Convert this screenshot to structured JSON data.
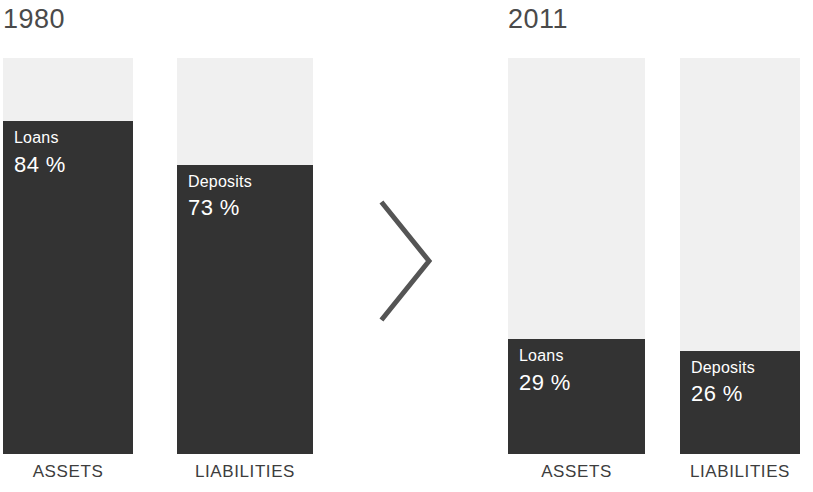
{
  "chart_data": {
    "type": "bar",
    "title": "",
    "subtitle": "",
    "xlabel": "",
    "ylabel": "",
    "ylim": [
      0,
      100
    ],
    "grid": false,
    "legend_position": "none",
    "note": "Stacked/filled bars: each bar represents 100% of the balance sheet side; the dark shaded portion is the labeled share.",
    "groups": [
      {
        "year": "1980",
        "bars": [
          {
            "category": "ASSETS",
            "series": "Loans",
            "value": 84,
            "value_label": "84 %",
            "remainder": 16
          },
          {
            "category": "LIABILITIES",
            "series": "Deposits",
            "value": 73,
            "value_label": "73 %",
            "remainder": 27
          }
        ]
      },
      {
        "year": "2011",
        "bars": [
          {
            "category": "ASSETS",
            "series": "Loans",
            "value": 29,
            "value_label": "29 %",
            "remainder": 71
          },
          {
            "category": "LIABILITIES",
            "series": "Deposits",
            "value": 26,
            "value_label": "26 %",
            "remainder": 74
          }
        ]
      }
    ],
    "categories": [
      "ASSETS",
      "LIABILITIES"
    ],
    "series": [
      {
        "name": "Loans",
        "values": [
          84,
          29
        ]
      },
      {
        "name": "Deposits",
        "values": [
          73,
          26
        ]
      }
    ],
    "x": [
      "1980",
      "2011"
    ],
    "colors": {
      "fill_dark": "#333333",
      "bar_background": "#f0f0f0",
      "page_background": "#ffffff",
      "year_text": "#4a4a4a",
      "category_text": "#3d3d3d",
      "value_text": "#ffffff",
      "chevron": "#555555"
    }
  },
  "years": {
    "left": "1980",
    "right": "2011"
  },
  "bars": {
    "left_assets": {
      "series": "Loans",
      "value_label": "84 %"
    },
    "left_liabilities": {
      "series": "Deposits",
      "value_label": "73 %"
    },
    "right_assets": {
      "series": "Loans",
      "value_label": "29 %"
    },
    "right_liabilities": {
      "series": "Deposits",
      "value_label": "26 %"
    }
  },
  "categories": {
    "left_assets": "ASSETS",
    "left_liabilities": "LIABILITIES",
    "right_assets": "ASSETS",
    "right_liabilities": "LIABILITIES"
  },
  "separator": {
    "icon": "chevron-right-icon"
  }
}
